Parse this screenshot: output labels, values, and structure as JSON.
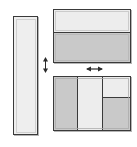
{
  "diagram": {
    "background_color": "#ffffff",
    "line_color": "#3a3a3a",
    "fill_light": "#ebebeb",
    "fill_dark": "#c9c9c9",
    "canvas": {
      "width": 137,
      "height": 147
    }
  },
  "parts": {
    "left_panel": {
      "name": "Tall vertical panel",
      "label": "",
      "fill": "#eeeeee",
      "x": 13,
      "y": 16,
      "width": 25,
      "height": 119,
      "orientation": "vertical",
      "divisions": 1
    },
    "top_assembly": {
      "name": "Upper horizontal assembly",
      "label": "",
      "x": 53,
      "y": 9,
      "width": 78,
      "height": 54,
      "split": "horizontal",
      "segments": [
        {
          "name": "upper-light-segment",
          "fill": "#ededed",
          "ratio": 0.45
        },
        {
          "name": "lower-shaded-segment",
          "fill": "#c9c9c9",
          "ratio": 0.55
        }
      ]
    },
    "bottom_assembly": {
      "name": "Lower horizontal assembly",
      "label": "",
      "x": 53,
      "y": 76,
      "width": 78,
      "height": 55,
      "split": "vertical",
      "columns": [
        {
          "name": "left-shaded-column",
          "fill": "#c9c9c9",
          "ratio": 0.31
        },
        {
          "name": "middle-light-column",
          "fill": "#ededed",
          "ratio": 0.34
        },
        {
          "name": "right-split-column",
          "ratio": 0.35,
          "split": "horizontal",
          "segments": [
            {
              "name": "right-upper-light",
              "fill": "#ededed",
              "ratio": 0.4
            },
            {
              "name": "right-lower-shaded",
              "fill": "#c9c9c9",
              "ratio": 0.6
            }
          ]
        }
      ]
    }
  },
  "markers": {
    "vertical_dimension": {
      "name": "vertical double-arrow dimension marker",
      "label": "",
      "direction": "vertical",
      "x": 42,
      "y": 57,
      "width": 7,
      "height": 16
    },
    "horizontal_dimension": {
      "name": "horizontal double-arrow dimension marker",
      "label": "",
      "direction": "horizontal",
      "x": 86,
      "y": 66,
      "width": 17,
      "height": 6
    }
  }
}
